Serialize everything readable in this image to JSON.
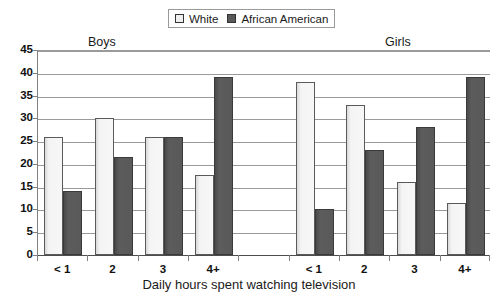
{
  "chart_data": {
    "type": "bar",
    "title": "",
    "xlabel": "Daily hours spent watching television",
    "ylabel": "",
    "ylim": [
      0,
      45
    ],
    "ytick_step": 5,
    "yticks": [
      "45",
      "40",
      "35",
      "30",
      "25",
      "20",
      "15",
      "10",
      "5",
      "0"
    ],
    "grid": true,
    "legend_position": "top-center",
    "group_labels": [
      "Boys",
      "Girls"
    ],
    "categories": [
      "< 1",
      "2",
      "3",
      "4+",
      "< 1",
      "2",
      "3",
      "4+"
    ],
    "series": [
      {
        "name": "White",
        "color": "#f2f2f2",
        "values": [
          26,
          30,
          26,
          17.5,
          38,
          33,
          16,
          11.5
        ]
      },
      {
        "name": "African American",
        "color": "#595959",
        "values": [
          14,
          21.5,
          26,
          39,
          10,
          23,
          28,
          39
        ]
      }
    ]
  },
  "legend": {
    "entries": [
      {
        "label": "White",
        "swatch": "white-swatch-icon"
      },
      {
        "label": "African American",
        "swatch": "dark-swatch-icon"
      }
    ]
  },
  "axes": {
    "x_title": "Daily hours spent watching television",
    "x_labels": [
      "< 1",
      "2",
      "3",
      "4+",
      "< 1",
      "2",
      "3",
      "4+"
    ],
    "y_labels": [
      "45",
      "40",
      "35",
      "30",
      "25",
      "20",
      "15",
      "10",
      "5",
      "0"
    ]
  },
  "sections": {
    "boys": "Boys",
    "girls": "Girls"
  },
  "colors": {
    "white_bar": "#f2f2f2",
    "dark_bar": "#595959",
    "gridline": "#9a9a9a",
    "axis": "#808080",
    "text": "#1a1a1a"
  }
}
